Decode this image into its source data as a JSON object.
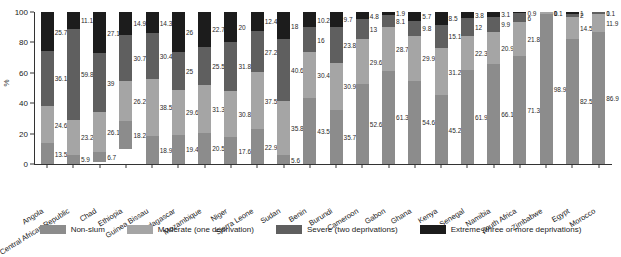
{
  "chart_data": {
    "type": "bar",
    "subtype": "stacked-bar-100",
    "title": "",
    "xlabel": "",
    "ylabel": "%",
    "ylim": [
      0,
      100
    ],
    "yticks": [
      0,
      20,
      40,
      60,
      80,
      100
    ],
    "grid": false,
    "legend_position": "bottom",
    "categories": [
      "Angola",
      "Central African Republic",
      "Chad",
      "Ethiopia",
      "Guinea Bissau",
      "Madagascar",
      "Mozambique",
      "Niger",
      "Sierra Leone",
      "Sudan",
      "Benin",
      "Burundi",
      "Cameroon",
      "Gabon",
      "Ghana",
      "Kenya",
      "Senegal",
      "Namibia",
      "South Africa",
      "Zimbabwe",
      "Egypt",
      "Morocco"
    ],
    "series": [
      {
        "name": "Non-slum",
        "color": "#8c8c8c",
        "values": [
          13.5,
          5.9,
          6.7,
          18.2,
          18.9,
          19.4,
          20.5,
          17.6,
          22.9,
          5.6,
          43.5,
          35.7,
          52.6,
          61.3,
          54.6,
          45.2,
          61.9,
          66.1,
          71.3,
          98.9,
          82.5,
          86.9
        ]
      },
      {
        "name": "Moderate (one deprivation)",
        "color": "#a5a5a5",
        "values": [
          24.6,
          23.2,
          26.1,
          26.2,
          38.5,
          29.6,
          31.3,
          30.8,
          37.5,
          35.8,
          30.4,
          30.9,
          29.6,
          28.7,
          29.9,
          31.2,
          22.3,
          20.9,
          21.8,
          1.1,
          14.5,
          11.9
        ]
      },
      {
        "name": "Severe (two deprivations)",
        "color": "#5f5f5f",
        "values": [
          36.1,
          59.8,
          39,
          30.7,
          30.4,
          25,
          25.5,
          31.8,
          27.2,
          40.6,
          16,
          23.8,
          13,
          8.1,
          9.8,
          15.1,
          12,
          9.9,
          6,
          0,
          2,
          1
        ]
      },
      {
        "name": "Extreme (three or more deprivations)",
        "color": "#1c1c1c",
        "values": [
          25.7,
          11.1,
          27.1,
          14.9,
          14.3,
          26,
          22.7,
          20,
          12.4,
          18,
          10.2,
          9.7,
          4.8,
          1.9,
          5.7,
          8.5,
          3.8,
          3.1,
          0.9,
          0,
          1,
          0.1
        ]
      }
    ]
  }
}
